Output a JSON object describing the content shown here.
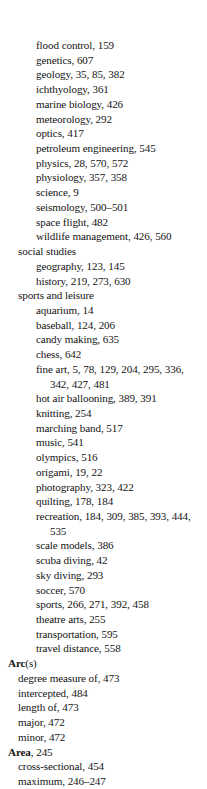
{
  "page": {
    "type": "book-index",
    "background_color": "#ffffff",
    "text_color": "#141414"
  },
  "entries": [
    {
      "level": 2,
      "text": "flood control, 159"
    },
    {
      "level": 2,
      "text": "genetics, 607"
    },
    {
      "level": 2,
      "text": "geology, 35, 85, 382"
    },
    {
      "level": 2,
      "text": "ichthyology, 361"
    },
    {
      "level": 2,
      "text": "marine biology, 426"
    },
    {
      "level": 2,
      "text": "meteorology, 292"
    },
    {
      "level": 2,
      "text": "optics, 417"
    },
    {
      "level": 2,
      "text": "petroleum engineering, 545"
    },
    {
      "level": 2,
      "text": "physics, 28, 570, 572"
    },
    {
      "level": 2,
      "text": "physiology, 357, 358"
    },
    {
      "level": 2,
      "text": "science, 9"
    },
    {
      "level": 2,
      "text": "seismology, 500–501"
    },
    {
      "level": 2,
      "text": "space flight, 482"
    },
    {
      "level": 2,
      "text": "wildlife management, 426, 560"
    },
    {
      "level": 1,
      "text": "social studies"
    },
    {
      "level": 2,
      "text": "geography, 123, 145"
    },
    {
      "level": 2,
      "text": "history, 219, 273, 630"
    },
    {
      "level": 1,
      "text": "sports and leisure"
    },
    {
      "level": 2,
      "text": "aquarium, 14"
    },
    {
      "level": 2,
      "text": "baseball, 124, 206"
    },
    {
      "level": 2,
      "text": "candy making, 635"
    },
    {
      "level": 2,
      "text": "chess, 642"
    },
    {
      "level": 2,
      "text": "fine art, 5, 78, 129, 204, 295, 336, 342, 427, 481",
      "wrap": true
    },
    {
      "level": 2,
      "text": "hot air ballooning, 389, 391"
    },
    {
      "level": 2,
      "text": "knitting, 254"
    },
    {
      "level": 2,
      "text": "marching band, 517"
    },
    {
      "level": 2,
      "text": "music, 541"
    },
    {
      "level": 2,
      "text": "olympics, 516"
    },
    {
      "level": 2,
      "text": "origami, 19, 22"
    },
    {
      "level": 2,
      "text": "photography, 323, 422"
    },
    {
      "level": 2,
      "text": "quilting, 178, 184"
    },
    {
      "level": 2,
      "text": "recreation, 184, 309, 385, 393, 444, 535",
      "wrap": true
    },
    {
      "level": 2,
      "text": "scale models, 386"
    },
    {
      "level": 2,
      "text": "scuba diving, 42"
    },
    {
      "level": 2,
      "text": "sky diving, 293"
    },
    {
      "level": 2,
      "text": "soccer, 570"
    },
    {
      "level": 2,
      "text": "sports, 266, 271, 392, 458"
    },
    {
      "level": 2,
      "text": "theatre arts, 255"
    },
    {
      "level": 2,
      "text": "transportation, 595"
    },
    {
      "level": 2,
      "text": "travel distance, 558"
    },
    {
      "level": 0,
      "headword": "Arc",
      "rest": "(s)"
    },
    {
      "level": 1,
      "text": "degree measure of, 473"
    },
    {
      "level": 1,
      "text": "intercepted, 484"
    },
    {
      "level": 1,
      "text": "length of, 473"
    },
    {
      "level": 1,
      "text": "major, 472"
    },
    {
      "level": 1,
      "text": "minor, 472"
    },
    {
      "level": 0,
      "headword": "Area",
      "rest": ", 245"
    },
    {
      "level": 1,
      "text": "cross-sectional, 454"
    },
    {
      "level": 1,
      "text": "maximum, 246–247"
    }
  ]
}
